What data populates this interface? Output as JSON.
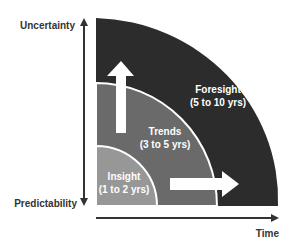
{
  "diagram": {
    "axes": {
      "y_top_label": "Uncertainty",
      "y_bottom_label": "Predictability",
      "x_label": "Time"
    },
    "zones": [
      {
        "name": "Insight",
        "range": "(1 to 2 yrs)",
        "color": "#979797"
      },
      {
        "name": "Trends",
        "range": "(3 to 5 yrs)",
        "color": "#6a6a6a"
      },
      {
        "name": "Foresight",
        "range": "(5 to 10 yrs)",
        "color": "#2c2c2c"
      }
    ],
    "arrows": [
      {
        "direction": "up",
        "meaning": "increasing uncertainty"
      },
      {
        "direction": "right",
        "meaning": "increasing time"
      }
    ],
    "colors": {
      "axis": "#333333",
      "separator": "#ffffff",
      "arrow": "#ffffff"
    }
  }
}
